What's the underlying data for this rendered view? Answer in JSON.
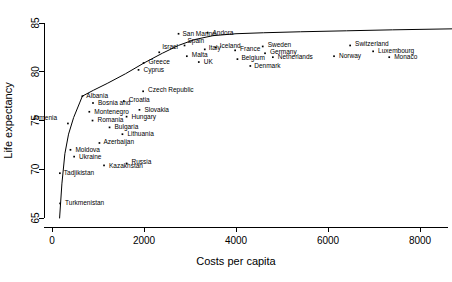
{
  "chart_data": {
    "type": "scatter",
    "title": "",
    "subtitle": "",
    "xlabel": "Costs per capita",
    "ylabel": "Life expectancy",
    "xlim": [
      0,
      8700
    ],
    "ylim": [
      65,
      85
    ],
    "xticks": [
      0,
      2000,
      4000,
      6000,
      8000
    ],
    "xticklabels": [
      "0",
      "2000",
      "4000",
      "6000",
      "8000"
    ],
    "yticks": [
      65,
      70,
      75,
      80,
      85
    ],
    "yticklabels": [
      "65",
      "70",
      "75",
      "80",
      "85"
    ],
    "grid": false,
    "legend": null,
    "legend_position": "none",
    "marker": "point",
    "marker_color": "#000000",
    "label_placement": "right-of-point",
    "annotations": [
      "Frontier envelope curve traced along the upper boundary of the point cloud"
    ],
    "points": [
      {
        "label": "Turkmenistan",
        "x": 175,
        "y": 66.5,
        "label_dx": 5,
        "label_dy": 2
      },
      {
        "label": "Tadjikistan",
        "x": 170,
        "y": 69.6,
        "label_dx": 4,
        "label_dy": 2
      },
      {
        "label": "Kazakhstan",
        "x": 1130,
        "y": 70.4,
        "label_dx": 5,
        "label_dy": 3
      },
      {
        "label": "Russia",
        "x": 1620,
        "y": 70.6,
        "label_dx": 5,
        "label_dy": 1
      },
      {
        "label": "Ukraine",
        "x": 480,
        "y": 71.3,
        "label_dx": 5,
        "label_dy": 2
      },
      {
        "label": "Moldova",
        "x": 400,
        "y": 72.0,
        "label_dx": 5,
        "label_dy": 2
      },
      {
        "label": "Azerbaijan",
        "x": 1030,
        "y": 72.7,
        "label_dx": 4,
        "label_dy": 1
      },
      {
        "label": "Lithuania",
        "x": 1530,
        "y": 73.6,
        "label_dx": 5,
        "label_dy": 2
      },
      {
        "label": "Bulgaria",
        "x": 1250,
        "y": 74.3,
        "label_dx": 5,
        "label_dy": 2
      },
      {
        "label": "Armenia",
        "x": 345,
        "y": 74.7,
        "label_dx": -35,
        "label_dy": -3
      },
      {
        "label": "Romania",
        "x": 880,
        "y": 75.0,
        "label_dx": 5,
        "label_dy": 1
      },
      {
        "label": "Hungary",
        "x": 1620,
        "y": 75.4,
        "label_dx": 5,
        "label_dy": 2
      },
      {
        "label": "Montenegro",
        "x": 810,
        "y": 75.9,
        "label_dx": 5,
        "label_dy": 2
      },
      {
        "label": "Slovakia",
        "x": 1900,
        "y": 76.1,
        "label_dx": 5,
        "label_dy": 2
      },
      {
        "label": "Bosnia and",
        "x": 890,
        "y": 76.8,
        "label_dx": 5,
        "label_dy": 2
      },
      {
        "label": "Croatia",
        "x": 1560,
        "y": 77.0,
        "label_dx": 5,
        "label_dy": 1
      },
      {
        "label": "Albania",
        "x": 660,
        "y": 77.5,
        "label_dx": 4,
        "label_dy": 2
      },
      {
        "label": "Czech Republic",
        "x": 1980,
        "y": 78.0,
        "label_dx": 5,
        "label_dy": 1
      },
      {
        "label": "Cyprus",
        "x": 1880,
        "y": 80.2,
        "label_dx": 5,
        "label_dy": 2
      },
      {
        "label": "Greece",
        "x": 1990,
        "y": 80.9,
        "label_dx": 5,
        "label_dy": 1
      },
      {
        "label": "UK",
        "x": 3190,
        "y": 81.0,
        "label_dx": 5,
        "label_dy": 2
      },
      {
        "label": "Malta",
        "x": 2930,
        "y": 81.6,
        "label_dx": 5,
        "label_dy": 1
      },
      {
        "label": "Israel",
        "x": 2330,
        "y": 82.0,
        "label_dx": 3,
        "label_dy": -3
      },
      {
        "label": "Italy",
        "x": 3320,
        "y": 82.3,
        "label_dx": 4,
        "label_dy": 1
      },
      {
        "label": "Spain",
        "x": 2880,
        "y": 82.7,
        "label_dx": 3,
        "label_dy": -2
      },
      {
        "label": "Denmark",
        "x": 4310,
        "y": 80.6,
        "label_dx": 4,
        "label_dy": 2
      },
      {
        "label": "Belgium",
        "x": 4030,
        "y": 81.3,
        "label_dx": 4,
        "label_dy": 1
      },
      {
        "label": "Netherlands",
        "x": 4800,
        "y": 81.5,
        "label_dx": 5,
        "label_dy": 2
      },
      {
        "label": "France",
        "x": 3980,
        "y": 82.2,
        "label_dx": 5,
        "label_dy": 1
      },
      {
        "label": "Germany",
        "x": 4630,
        "y": 81.9,
        "label_dx": 5,
        "label_dy": 1
      },
      {
        "label": "Sweden",
        "x": 4580,
        "y": 82.6,
        "label_dx": 5,
        "label_dy": 1
      },
      {
        "label": "Iceland",
        "x": 3560,
        "y": 82.5,
        "label_dx": 4,
        "label_dy": 1
      },
      {
        "label": "San Marino",
        "x": 2750,
        "y": 83.9,
        "label_dx": 4,
        "label_dy": 0
      },
      {
        "label": "Andora",
        "x": 3380,
        "y": 84.0,
        "label_dx": 5,
        "label_dy": 0
      },
      {
        "label": "Norway",
        "x": 6130,
        "y": 81.6,
        "label_dx": 5,
        "label_dy": 2
      },
      {
        "label": "Switzerland",
        "x": 6480,
        "y": 82.7,
        "label_dx": 5,
        "label_dy": 1
      },
      {
        "label": "Luxembourg",
        "x": 6980,
        "y": 82.1,
        "label_dx": 5,
        "label_dy": 2
      },
      {
        "label": "Monaco",
        "x": 7330,
        "y": 81.5,
        "label_dx": 5,
        "label_dy": 2
      }
    ],
    "frontier": [
      {
        "x": 165,
        "y": 65.0
      },
      {
        "x": 215,
        "y": 68.5
      },
      {
        "x": 280,
        "y": 71.6
      },
      {
        "x": 360,
        "y": 73.6
      },
      {
        "x": 470,
        "y": 75.3
      },
      {
        "x": 600,
        "y": 76.8
      },
      {
        "x": 660,
        "y": 77.5
      },
      {
        "x": 900,
        "y": 78.1
      },
      {
        "x": 1200,
        "y": 78.8
      },
      {
        "x": 1600,
        "y": 79.8
      },
      {
        "x": 2000,
        "y": 80.9
      },
      {
        "x": 2400,
        "y": 81.9
      },
      {
        "x": 2750,
        "y": 82.7
      },
      {
        "x": 3100,
        "y": 83.3
      },
      {
        "x": 3500,
        "y": 83.7
      },
      {
        "x": 4000,
        "y": 83.9
      },
      {
        "x": 4600,
        "y": 84.0
      },
      {
        "x": 5400,
        "y": 84.1
      },
      {
        "x": 6400,
        "y": 84.2
      },
      {
        "x": 7400,
        "y": 84.3
      },
      {
        "x": 8700,
        "y": 84.4
      }
    ]
  }
}
